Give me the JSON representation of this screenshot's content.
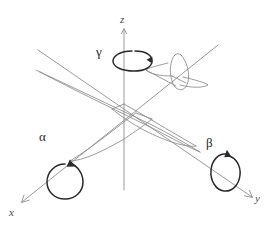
{
  "figure": {
    "background_color": "#ffffff",
    "width": 274,
    "height": 232
  },
  "axes": {
    "z": {
      "label": "z",
      "description": "vertical axis",
      "color": "#8e8e92",
      "origin": [
        124,
        118
      ],
      "tip": [
        124,
        29
      ],
      "tail": [
        124,
        190
      ]
    },
    "x": {
      "label": "x",
      "description": "axis toward lower-left",
      "color": "#8e8e92",
      "origin": [
        124,
        118
      ],
      "tip": [
        22,
        202
      ],
      "tail": [
        218,
        45
      ]
    },
    "y": {
      "label": "y",
      "description": "axis toward lower-right",
      "color": "#8e8e92",
      "origin": [
        124,
        118
      ],
      "tip": [
        252,
        197
      ],
      "tail": [
        38,
        50
      ]
    }
  },
  "angles": [
    {
      "symbol": "γ",
      "name": "gamma",
      "about_axis": "z",
      "description": "yaw rotation about the z axis",
      "arrow_color": "#2b2b2f"
    },
    {
      "symbol": "α",
      "name": "alpha",
      "about_axis": "x",
      "description": "roll rotation about the x axis",
      "arrow_color": "#2b2b2f"
    },
    {
      "symbol": "β",
      "name": "beta",
      "about_axis": "y",
      "description": "pitch rotation about the y axis",
      "arrow_color": "#2b2b2f"
    }
  ],
  "aircraft": {
    "name": "glider-aircraft",
    "line_color": "#8a8a8e",
    "parts": [
      "fuselage",
      "left-wing",
      "right-wing",
      "horizontal-stabilizer",
      "vertical-stabilizer"
    ]
  },
  "artifacts": {
    "ghost_watermark_text": ""
  }
}
